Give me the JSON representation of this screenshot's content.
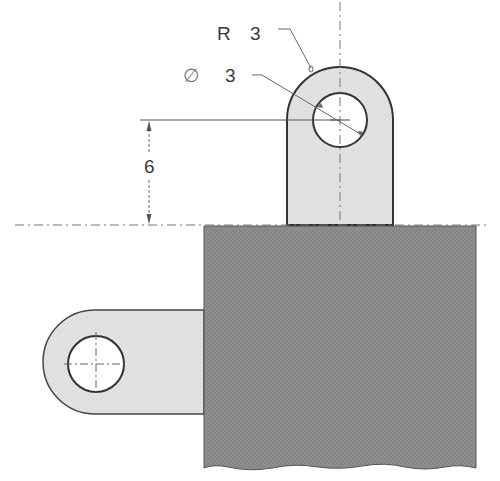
{
  "drawing": {
    "title": "Bracket with lugs - dimensioned view",
    "labels": {
      "radius": {
        "prefix": "R",
        "value": "3"
      },
      "diameter": {
        "prefix": "∅",
        "value": "3"
      },
      "height_dim": "6"
    },
    "colors": {
      "block_fill": "#8c8c8c",
      "tab_fill": "#e2e2e2",
      "outline": "#3c3c3c",
      "centerline": "#777777",
      "background": "#ffffff"
    },
    "features": [
      {
        "name": "upper-lug",
        "hole": true
      },
      {
        "name": "side-lug",
        "hole": true
      },
      {
        "name": "main-block",
        "broken_edge": "bottom"
      }
    ]
  }
}
